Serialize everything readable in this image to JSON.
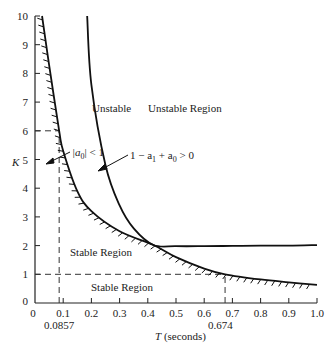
{
  "chart_data": {
    "type": "line",
    "title": "",
    "xlabel": "T (seconds)",
    "ylabel": "K",
    "xlim": [
      0,
      1.0
    ],
    "ylim": [
      0,
      10
    ],
    "grid": false,
    "x_ticks": [
      "0",
      "0.1",
      "0.2",
      "0.3",
      "0.4",
      "0.5",
      "0.6",
      "0.7",
      "0.8",
      "0.9",
      "1.0"
    ],
    "y_ticks": [
      "0",
      "1",
      "2",
      "3",
      "4",
      "5",
      "6",
      "7",
      "8",
      "9",
      "10"
    ],
    "extra_x_labels": [
      {
        "value": 0.0857,
        "label": "0.0857"
      },
      {
        "value": 0.674,
        "label": "0.674"
      }
    ],
    "series": [
      {
        "name": "|a0| < 1 boundary",
        "style": "solid, hatched",
        "x": [
          0.025,
          0.05,
          0.0857,
          0.1,
          0.15,
          0.2,
          0.3,
          0.42,
          0.5,
          0.6,
          0.674,
          0.8,
          0.9,
          1.0
        ],
        "y": [
          10.0,
          8.3,
          6.0,
          5.3,
          3.9,
          3.2,
          2.5,
          2.02,
          1.6,
          1.2,
          1.0,
          0.82,
          0.72,
          0.63
        ]
      },
      {
        "name": "1 - a1 + a0 > 0 boundary",
        "style": "solid",
        "x": [
          0.185,
          0.2,
          0.25,
          0.3,
          0.35,
          0.42,
          0.5,
          0.6,
          0.7,
          0.8,
          0.9,
          1.0
        ],
        "y": [
          10.0,
          7.6,
          4.8,
          3.4,
          2.6,
          2.02,
          1.98,
          1.98,
          1.99,
          2.0,
          2.0,
          2.02
        ]
      }
    ],
    "reference_lines": [
      {
        "type": "dashed",
        "from": [
          0,
          6
        ],
        "to": [
          0.0857,
          6
        ]
      },
      {
        "type": "dashed",
        "from": [
          0.0857,
          0
        ],
        "to": [
          0.0857,
          6
        ]
      },
      {
        "type": "dashed",
        "from": [
          0,
          1
        ],
        "to": [
          0.674,
          1
        ]
      },
      {
        "type": "dashed",
        "from": [
          0.674,
          0
        ],
        "to": [
          0.674,
          1
        ]
      }
    ],
    "annotations": [
      {
        "text": "Unstable",
        "x": 0.28,
        "y": 6.9
      },
      {
        "text": "Unstable Region",
        "x": 0.57,
        "y": 6.9
      },
      {
        "text": "|a0| < 1",
        "x": 0.13,
        "y": 5.4
      },
      {
        "text": "1 − a1 + a0 > 0",
        "x": 0.47,
        "y": 5.1
      },
      {
        "text": "Stable Region",
        "x": 0.21,
        "y": 1.75
      },
      {
        "text": "Stable Region",
        "x": 0.3,
        "y": 0.5
      }
    ]
  },
  "labels": {
    "ylabel": "K",
    "xlabel_var": "T",
    "xlabel_unit": " (seconds)",
    "unstable": "Unstable",
    "unstable_region": "Unstable Region",
    "a0_cond_pre": "|a",
    "a0_cond_sub": "0",
    "a0_cond_post": "| < 1",
    "stab_pre": "1 − a",
    "stab_sub1": "1",
    "stab_mid": " + a",
    "stab_sub2": "0",
    "stab_post": " > 0",
    "stable_region_1": "Stable Region",
    "stable_region_2": "Stable Region",
    "x_extra_1": "0.0857",
    "x_extra_2": "0.674"
  }
}
